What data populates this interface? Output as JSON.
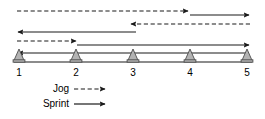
{
  "figure": {
    "type": "shuttle-run-drill-diagram",
    "width": 265,
    "height": 119,
    "background_color": "#ffffff",
    "line_color": "#1a1a1a",
    "cone_fill_color": "#b3b3b3",
    "cone_stroke_color": "#4d4d4d"
  },
  "baseline": {
    "y": 62,
    "x_start": 14,
    "x_end": 252
  },
  "cones": [
    {
      "label": "1",
      "x": 19,
      "y": 62,
      "label_y": 76
    },
    {
      "label": "2",
      "x": 76,
      "y": 62,
      "label_y": 76
    },
    {
      "label": "3",
      "x": 133,
      "y": 62,
      "label_y": 76
    },
    {
      "label": "4",
      "x": 190,
      "y": 62,
      "label_y": 76
    },
    {
      "label": "5",
      "x": 247,
      "y": 62,
      "label_y": 76
    }
  ],
  "paths": [
    {
      "name": "jog-cone1-to-cone4",
      "style": "dashed",
      "direction": "right",
      "from_cone": "1",
      "to_cone": "4",
      "x1": 17,
      "x2": 188,
      "y": 11
    },
    {
      "name": "sprint-cone4-to-cone5",
      "style": "solid",
      "direction": "right",
      "from_cone": "4",
      "to_cone": "5",
      "x1": 190,
      "x2": 249,
      "y": 15
    },
    {
      "name": "jog-cone5-to-cone3",
      "style": "dashed",
      "direction": "left",
      "from_cone": "5",
      "to_cone": "3",
      "x1": 250,
      "x2": 131,
      "y": 24
    },
    {
      "name": "sprint-cone3-to-cone1",
      "style": "solid",
      "direction": "left",
      "from_cone": "3",
      "to_cone": "1",
      "x1": 136,
      "x2": 18,
      "y": 32
    },
    {
      "name": "jog-cone1-to-cone2",
      "style": "dashed",
      "direction": "right",
      "from_cone": "1",
      "to_cone": "2",
      "x1": 17,
      "x2": 76,
      "y": 41
    },
    {
      "name": "sprint-cone2-to-cone5",
      "style": "solid",
      "direction": "right",
      "from_cone": "2",
      "to_cone": "5",
      "x1": 77,
      "x2": 249,
      "y": 45
    },
    {
      "name": "sprint-cone5-to-cone1",
      "style": "solid",
      "direction": "left",
      "from_cone": "5",
      "to_cone": "1",
      "x1": 249,
      "x2": 18,
      "y": 53
    }
  ],
  "legend": {
    "items": [
      {
        "label": "Jog",
        "style": "dashed",
        "label_x": 69,
        "label_y": 92,
        "line_x1": 74,
        "line_x2": 105,
        "line_y": 89
      },
      {
        "label": "Sprint",
        "style": "solid",
        "label_x": 69,
        "label_y": 107,
        "line_x1": 74,
        "line_x2": 105,
        "line_y": 104
      }
    ]
  }
}
